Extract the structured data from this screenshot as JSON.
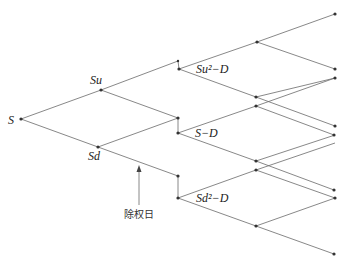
{
  "diagram": {
    "type": "binomial-tree-with-dividend",
    "labels": {
      "root": "S",
      "up": "Su",
      "down": "Sd",
      "upup_minus_d": "Su²−D",
      "mid_minus_d": "S−D",
      "downdown_minus_d": "Sd²−D",
      "ex_dividend_date": "除权日"
    },
    "colors": {
      "edge": "#6a6a6a",
      "node": "#333333",
      "text": "#222222"
    }
  }
}
